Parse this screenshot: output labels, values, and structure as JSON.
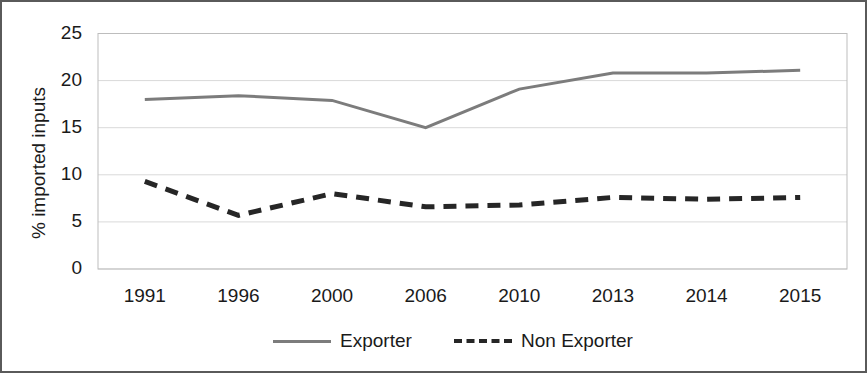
{
  "chart_data": {
    "type": "line",
    "title": "",
    "subtitle": "",
    "xlabel": "",
    "ylabel": "% imported inputs",
    "categories": [
      "1991",
      "1996",
      "2000",
      "2006",
      "2010",
      "2013",
      "2014",
      "2015"
    ],
    "yticks": [
      "0",
      "5",
      "10",
      "15",
      "20",
      "25"
    ],
    "ylim": [
      0,
      25
    ],
    "grid": "horizontal",
    "legend_position": "bottom",
    "series": [
      {
        "name": "Exporter",
        "style": "solid",
        "color": "#7c7c7c",
        "values": [
          18.0,
          18.4,
          17.9,
          15.0,
          19.1,
          20.8,
          20.8,
          21.1
        ]
      },
      {
        "name": "Non Exporter",
        "style": "dashed",
        "color": "#262626",
        "values": [
          9.3,
          5.7,
          8.0,
          6.6,
          6.8,
          7.6,
          7.4,
          7.6
        ]
      }
    ]
  },
  "colors": {
    "exporter": "#7c7c7c",
    "non_exporter": "#262626",
    "gridline": "#d9d9d9",
    "axis": "#bdbdbd",
    "border": "#5a5a5a",
    "text": "#1a1a1a",
    "background": "#ffffff"
  }
}
